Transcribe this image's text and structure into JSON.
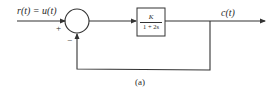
{
  "diagram": {
    "input": {
      "label": "r(t) = u(t)"
    },
    "summing_junction": {
      "plus_sign": "+",
      "minus_sign": "−"
    },
    "forward_block": {
      "numerator": "K",
      "denominator": "1 + 2s"
    },
    "output": {
      "label": "c(t)"
    },
    "feedback": {
      "type": "unity negative feedback"
    },
    "caption": "(a)"
  },
  "colors": {
    "line": "#333333",
    "text": "#2a2a2a",
    "background": "#ffffff"
  }
}
